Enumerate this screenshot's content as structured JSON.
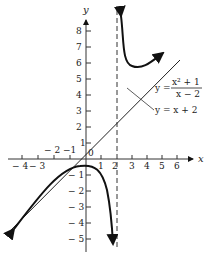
{
  "figure": {
    "axes": {
      "x_label": "x",
      "y_label": "y",
      "x_ticks": [
        "-4",
        "-3",
        "-2",
        "-1",
        "0",
        "1",
        "2",
        "3",
        "4",
        "5",
        "6"
      ],
      "y_ticks": [
        "8",
        "7",
        "6",
        "5",
        "4",
        "3",
        "2",
        "1",
        "-1",
        "-2",
        "-3",
        "-4",
        "-5"
      ]
    },
    "curve_label": {
      "lhs": "y =",
      "numerator": "x² + 1",
      "denominator": "x − 2"
    },
    "asymptote_label": "y = x + 2",
    "vertical_asymptote": "x = 2"
  },
  "labels": {
    "x_ticks": {
      "m4": "− 4",
      "m3": "− 3",
      "m2": "− 2",
      "m1": "−1",
      "zero": "0",
      "p1": "1",
      "p2": "2",
      "p3": "3",
      "p4": "4",
      "p5": "5",
      "p6": "6"
    },
    "y_ticks": {
      "p8": "8",
      "p7": "7",
      "p6": "6",
      "p5": "5",
      "p4": "4",
      "p3": "3",
      "p2": "2",
      "p1": "1",
      "m1": "− 1",
      "m2": "− 2",
      "m3": "− 3",
      "m4": "− 4",
      "m5": "− 5"
    }
  }
}
